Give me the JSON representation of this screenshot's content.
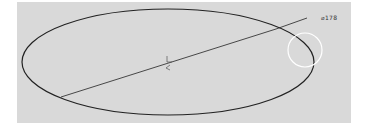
{
  "viewport": {
    "background": "#d9d9d9",
    "page_background": "#ffffff"
  },
  "sketch": {
    "entities": [
      {
        "type": "ellipse",
        "name": "ellipse",
        "cx": 168,
        "cy": 62,
        "rx": 146,
        "ry": 53,
        "stroke": "#222222"
      },
      {
        "type": "line",
        "name": "diameter-dimension-line",
        "points": [
          [
            61,
            97
          ],
          [
            276,
            29
          ],
          [
            307,
            18
          ]
        ],
        "stroke": "#222222"
      },
      {
        "type": "circle",
        "name": "selection-highlight",
        "cx": 305,
        "cy": 50,
        "r": 17,
        "stroke": "#ffffff"
      },
      {
        "type": "center-mark",
        "name": "center-mark",
        "x": 168,
        "y": 62
      }
    ],
    "dimension": {
      "label": "⌀178",
      "x": 321,
      "y": 14
    }
  }
}
